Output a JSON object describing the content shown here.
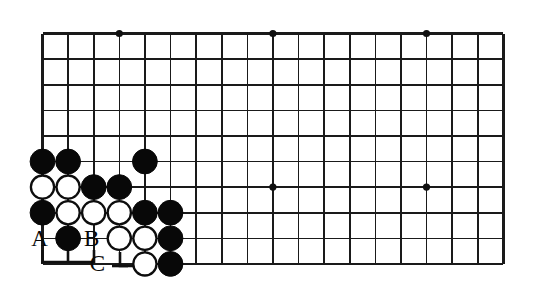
{
  "diagram": {
    "type": "go-board-position",
    "board": {
      "origin_x": 42.5,
      "origin_y": 33.5,
      "spacing": 25.6,
      "cols": 19,
      "rows": 10,
      "line_color": "#1a1a1a",
      "background_color": "#ffffff",
      "star_points": [
        {
          "col": 3,
          "row": 0
        },
        {
          "col": 9,
          "row": 0
        },
        {
          "col": 15,
          "row": 0
        },
        {
          "col": 3,
          "row": 6
        },
        {
          "col": 9,
          "row": 6
        },
        {
          "col": 15,
          "row": 6
        }
      ]
    },
    "stones": [
      {
        "col": 0,
        "row": 5,
        "color": "black"
      },
      {
        "col": 1,
        "row": 5,
        "color": "black"
      },
      {
        "col": 4,
        "row": 5,
        "color": "black"
      },
      {
        "col": 0,
        "row": 6,
        "color": "white"
      },
      {
        "col": 1,
        "row": 6,
        "color": "white"
      },
      {
        "col": 2,
        "row": 6,
        "color": "black"
      },
      {
        "col": 3,
        "row": 6,
        "color": "black"
      },
      {
        "col": 0,
        "row": 7,
        "color": "black"
      },
      {
        "col": 1,
        "row": 7,
        "color": "white"
      },
      {
        "col": 2,
        "row": 7,
        "color": "white"
      },
      {
        "col": 3,
        "row": 7,
        "color": "white"
      },
      {
        "col": 4,
        "row": 7,
        "color": "black"
      },
      {
        "col": 5,
        "row": 7,
        "color": "black"
      },
      {
        "col": 1,
        "row": 8,
        "color": "black"
      },
      {
        "col": 3,
        "row": 8,
        "color": "white"
      },
      {
        "col": 4,
        "row": 8,
        "color": "white"
      },
      {
        "col": 5,
        "row": 8,
        "color": "black"
      },
      {
        "col": 4,
        "row": 9,
        "color": "white"
      },
      {
        "col": 5,
        "row": 9,
        "color": "black"
      }
    ],
    "labels": [
      {
        "id": "label-a",
        "text": "A",
        "col": 0,
        "row": 8,
        "dx": -3,
        "dy": 8
      },
      {
        "id": "label-b",
        "text": "B",
        "col": 2,
        "row": 8,
        "dx": -2,
        "dy": 8
      },
      {
        "id": "label-c",
        "text": "C",
        "col": 3,
        "row": 9,
        "dx": -22,
        "dy": 7
      }
    ],
    "markers": [
      {
        "id": "bracket-ab",
        "description": "bracket joining point A and the stone at B column under row 8",
        "points": "42.5,250 42.5,262 94,262 94,250"
      },
      {
        "id": "tick-b-stem",
        "description": "short stem from the black stone at column 1 row 8 down to the bracket",
        "points": "68,248 68,262"
      },
      {
        "id": "bracket-c",
        "description": "tee marker linking point C to the white stone at column 3 row 9",
        "points": "120,252 120,266 146,266"
      },
      {
        "id": "tick-c-left",
        "description": "left arm of the C tee",
        "points": "112,266 128,266"
      }
    ]
  }
}
